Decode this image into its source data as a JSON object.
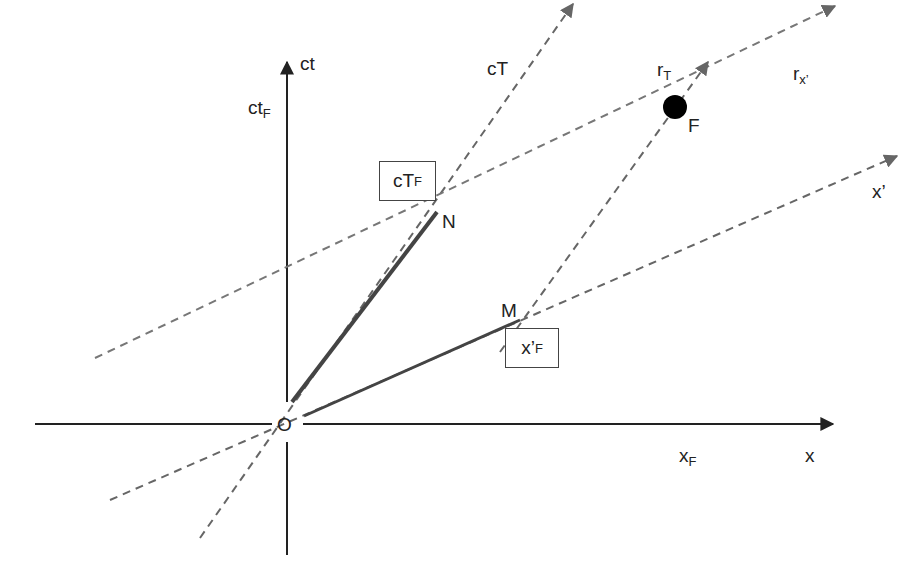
{
  "diagram": {
    "type": "spacetime-diagram",
    "axes": {
      "ct": {
        "label": "ct"
      },
      "x": {
        "label": "x"
      },
      "cT": {
        "label": "cT"
      },
      "x_prime": {
        "label": "x’"
      }
    },
    "lines": {
      "r_T": {
        "label": "r",
        "sub": "T"
      },
      "r_x": {
        "label": "r",
        "sub": "x’"
      }
    },
    "points": {
      "origin": {
        "label": "O"
      },
      "N": {
        "label": "N"
      },
      "M": {
        "label": "M"
      },
      "F": {
        "label": "F"
      }
    },
    "projections": {
      "ct_F": {
        "label": "ct",
        "sub": "F"
      },
      "x_F": {
        "label": "x",
        "sub": "F"
      },
      "cT_F": {
        "label": "cT",
        "sub": "F"
      },
      "x_prime_F": {
        "label": "x’",
        "sub": "F"
      }
    },
    "colors": {
      "axis": "#222222",
      "dashed": "#666666",
      "segment": "#444444",
      "event": "#000000"
    }
  }
}
